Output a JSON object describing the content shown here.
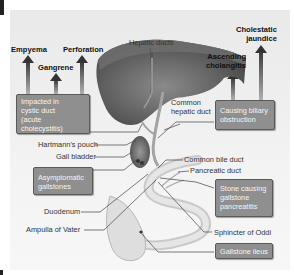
{
  "complications": {
    "empyema": "Empyema",
    "gangrene": "Gangrene",
    "perforation": "Perforation",
    "ascending_cholangitis": [
      "Ascending",
      "cholangitis"
    ],
    "cholestatic_jaundice": [
      "Cholestatic",
      "jaundice"
    ]
  },
  "boxes": {
    "impacted": [
      "Impacted in",
      "cystic duct",
      "(acute cholecystitis)"
    ],
    "biliary": [
      "Causing biliary",
      "obstruction"
    ],
    "asymptomatic": [
      "Asymptomatic",
      "gallstones"
    ],
    "pancreatitis": [
      "Stone causing",
      "gallstone",
      "pancreatitis"
    ],
    "ileus": [
      "Gallstone ileus"
    ]
  },
  "anatomy": {
    "hepatic_ducts": "Hepatic ducts",
    "common_hepatic_duct": [
      "Common",
      "hepatic duct"
    ],
    "hartmanns_pouch": "Hartmann's pouch",
    "gall_bladder": "Gall bladder",
    "common_bile_duct": "Common bile duct",
    "pancreatic_duct": "Pancreatic duct",
    "duodenum": "Duodenum",
    "ampulla": "Ampulla of Vater",
    "sphincter": "Sphincter of Oddi"
  },
  "colors": {
    "box_fill": "#8f8f8f",
    "liver": "#5e5e5e",
    "background": "#efefef"
  }
}
